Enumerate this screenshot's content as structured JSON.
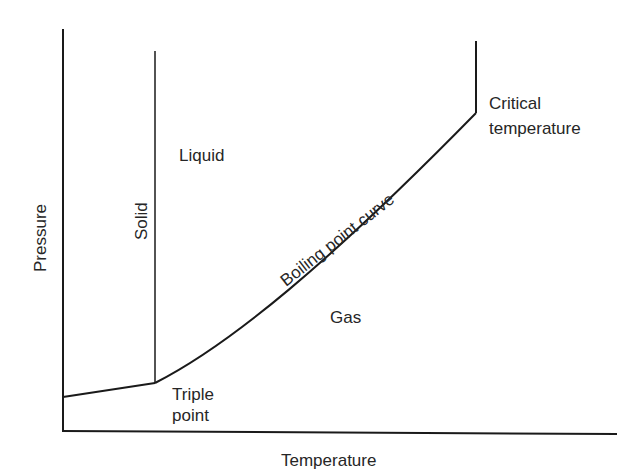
{
  "diagram": {
    "axes": {
      "x_label": "Temperature",
      "y_label": "Pressure"
    },
    "regions": {
      "solid": "Solid",
      "liquid": "Liquid",
      "gas": "Gas"
    },
    "curves": {
      "boiling": "Boiling point curve"
    },
    "points": {
      "triple_line1": "Triple",
      "triple_line2": "point",
      "critical_line1": "Critical",
      "critical_line2": "temperature"
    },
    "colors": {
      "line": "#1a1a1a",
      "text": "#262626",
      "background": "#ffffff"
    }
  }
}
